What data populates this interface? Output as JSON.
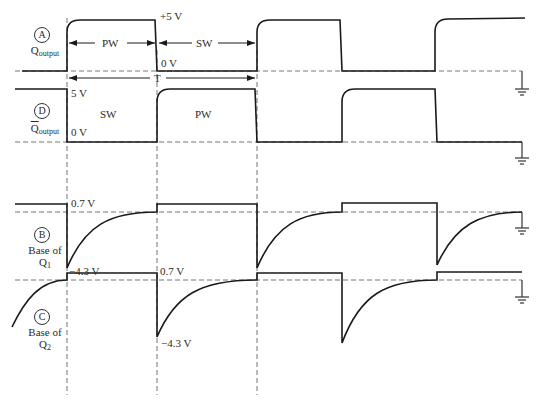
{
  "colors": {
    "trace": "#1a1a1a",
    "reference": "#777777",
    "text": "#2a2a2a"
  },
  "signals": [
    {
      "id": "A",
      "name": "Q",
      "subscript": "output",
      "overline": false,
      "levels": {
        "high": "+5 V",
        "low": "0 V"
      }
    },
    {
      "id": "D",
      "name": "Q",
      "subscript": "output",
      "overline": true,
      "levels": {
        "high": "5 V",
        "low": "0 V"
      }
    },
    {
      "id": "B",
      "name": "Base of",
      "name2": "Q",
      "subscript": "1",
      "levels": {
        "high": "0.7 V",
        "low": "−4.3 V"
      }
    },
    {
      "id": "C",
      "name": "Base of",
      "name2": "Q",
      "subscript": "2",
      "levels": {
        "high": "0.7 V",
        "low": "−4.3 V"
      }
    }
  ],
  "annotations": {
    "pw": "PW",
    "sw": "SW",
    "period": "T",
    "sw_lower": "SW",
    "pw_lower": "PW"
  },
  "timing_markers_x": [
    67,
    157,
    257,
    342,
    435
  ],
  "icons": [
    "ground-icon",
    "ground-icon",
    "ground-icon",
    "ground-icon"
  ]
}
